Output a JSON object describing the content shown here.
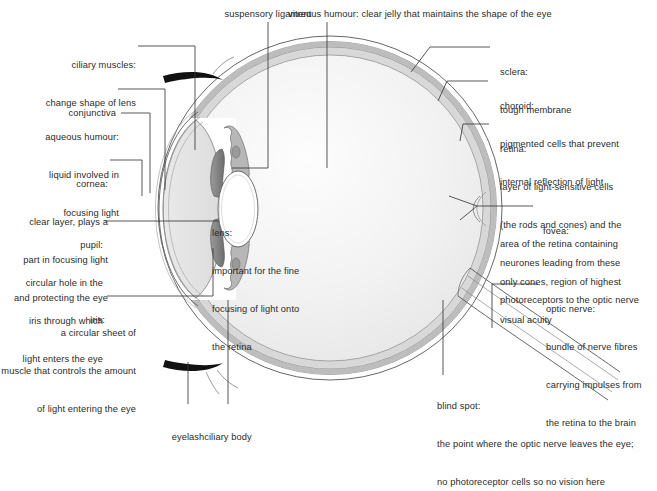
{
  "diagram": {
    "background_color": "#ffffff",
    "text_color": "#2b2b2b",
    "line_color": "#3a3a3a",
    "colors": {
      "sclera": "#ffffff",
      "choroid": "#b9b9b9",
      "retina": "#d6d6d6",
      "vitreous": "#f0f0f0",
      "aqueous": "#e4e4e4",
      "iris": "#8c8c8c",
      "ciliary_body": "#b0b0b0",
      "lens": "#ffffff",
      "eyelash": "#111111"
    }
  },
  "labels": {
    "suspensory_ligament": {
      "lines": [
        "suspensory ligament"
      ]
    },
    "vitreous_humour": {
      "lines": [
        "vitreous humour: clear jelly that maintains the shape of the eye"
      ]
    },
    "ciliary_muscles": {
      "lines": [
        "ciliary muscles:",
        "change shape of lens"
      ]
    },
    "conjunctiva": {
      "lines": [
        "conjunctiva"
      ]
    },
    "aqueous_humour": {
      "lines": [
        "aqueous humour:",
        "liquid involved in",
        "focusing light"
      ]
    },
    "cornea": {
      "lines": [
        "cornea:",
        "clear layer, plays a",
        "part in focusing light",
        "and protecting the eye"
      ]
    },
    "pupil": {
      "lines": [
        "pupil:",
        "circular hole in the",
        "iris through which",
        "light enters the eye"
      ]
    },
    "iris": {
      "lines": [
        "iris:",
        "a circular sheet of",
        "muscle that controls the amount",
        "of light entering the eye"
      ]
    },
    "eyelash": {
      "lines": [
        "eyelash"
      ]
    },
    "ciliary_body": {
      "lines": [
        "ciliary body"
      ]
    },
    "lens": {
      "lines": [
        "lens:",
        "important for the fine",
        "focusing of light onto",
        "the retina"
      ]
    },
    "sclera": {
      "lines": [
        "sclera:",
        "tough membrane"
      ]
    },
    "choroid": {
      "lines": [
        "choroid:",
        "pigmented cells that prevent",
        "internal reflection of light"
      ]
    },
    "retina": {
      "lines": [
        "retina:",
        "layer of light-sensitive cells",
        "(the rods and cones) and the",
        "neurones leading from these",
        "photoreceptors to the optic nerve"
      ]
    },
    "fovea": {
      "lines": [
        "fovea:",
        "area of the retina containing",
        "only cones, region of highest",
        "visual acuity"
      ]
    },
    "optic_nerve": {
      "lines": [
        "optic nerve:",
        "bundle of nerve fibres",
        "carrying impulses from",
        "the retina to the brain"
      ]
    },
    "blind_spot": {
      "lines": [
        "blind spot:",
        "the point where the optic nerve leaves the eye;",
        "no photoreceptor cells so no vision here"
      ]
    }
  }
}
